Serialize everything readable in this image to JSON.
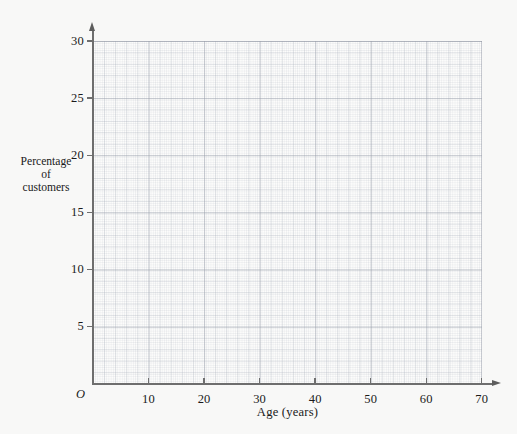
{
  "chart_data": {
    "type": "scatter",
    "title": "",
    "subtitle": "",
    "xlabel": "Age (years)",
    "ylabel": "Percentage of customers",
    "ylabel_lines": [
      "Percentage",
      "of",
      "customers"
    ],
    "origin_label": "O",
    "xlim": [
      0,
      70
    ],
    "ylim": [
      0,
      30
    ],
    "xticks": [
      0,
      10,
      20,
      30,
      40,
      50,
      60,
      70
    ],
    "xtick_labels": [
      "",
      "10",
      "20",
      "30",
      "40",
      "50",
      "60",
      "70"
    ],
    "yticks": [
      5,
      10,
      15,
      20,
      25,
      30
    ],
    "ytick_labels": [
      "5",
      "10",
      "15",
      "20",
      "25",
      "30"
    ],
    "grid": true,
    "grid_style": "graph-paper",
    "legend": null,
    "series": [],
    "x": [],
    "values": [],
    "annotations": [],
    "note": "Blank graph-paper axes; no data plotted."
  },
  "colors": {
    "background": "#f8f8f7",
    "plot_background": "#fcfcfb",
    "grid_major": "#969ca8",
    "grid_minor": "#b0b6c2",
    "axis": "#6e6e6e",
    "text": "#1a1a1a"
  }
}
